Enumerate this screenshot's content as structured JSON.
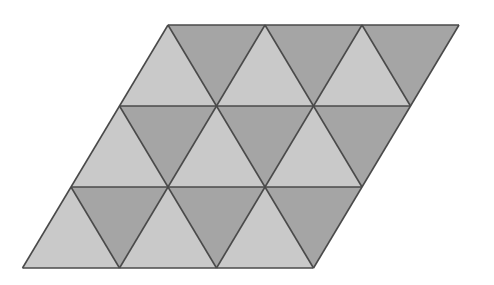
{
  "figure": {
    "rows": 3,
    "triangles_per_row": 6,
    "total_triangles": 18,
    "light_triangles": 9,
    "dark_triangles": 9,
    "colors": {
      "light": "#c9c9c9",
      "dark": "#a5a5a5",
      "edge": "#4a4a4a",
      "background": "#ffffff"
    },
    "vertices": {
      "top_left": [
        168,
        25
      ],
      "top_right": [
        459,
        25
      ],
      "bottom_right": [
        313.5,
        268
      ],
      "bottom_left": [
        22.5,
        268
      ]
    },
    "side_length": 97,
    "row_height": 81
  }
}
